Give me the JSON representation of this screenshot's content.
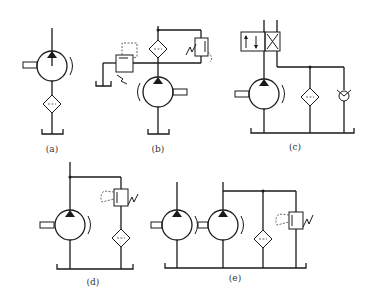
{
  "figure": {
    "panels": [
      {
        "id": "a",
        "caption": "(a)",
        "components": [
          "pump",
          "filter",
          "tank"
        ]
      },
      {
        "id": "b",
        "caption": "(b)",
        "components": [
          "pump",
          "filter",
          "relief-valve",
          "bypass-valve",
          "tank"
        ]
      },
      {
        "id": "c",
        "caption": "(c)",
        "components": [
          "directional-valve",
          "pump",
          "filter",
          "check-valve",
          "tank"
        ]
      },
      {
        "id": "d",
        "caption": "(d)",
        "components": [
          "pump",
          "relief-valve",
          "filter",
          "tank"
        ]
      },
      {
        "id": "e",
        "caption": "(e)",
        "components": [
          "pump",
          "pump",
          "filter",
          "relief-valve",
          "tank"
        ]
      }
    ]
  },
  "colors": {
    "line": "#1a1a1a",
    "dashed": "#555555",
    "background": "#ffffff"
  }
}
